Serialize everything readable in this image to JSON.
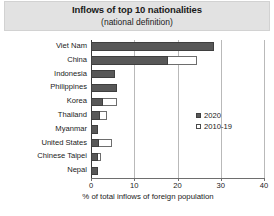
{
  "chart_data": {
    "type": "bar",
    "orientation": "horizontal",
    "title": "Inflows of top 10 nationalities",
    "subtitle": "(national definition)",
    "xlabel": "% of total inflows of foreign population",
    "ylabel": "",
    "xlim": [
      0,
      40
    ],
    "xticks": [
      0,
      10,
      20,
      30,
      40
    ],
    "xtick_labels": [
      "0",
      "10",
      "20",
      "30",
      "40"
    ],
    "grid": true,
    "grid_axis": "x",
    "legend_position": "center-right",
    "categories": [
      "Viet Nam",
      "China",
      "Indonesia",
      "Philippines",
      "Korea",
      "Thailand",
      "Myanmar",
      "United States",
      "Chinese Taipei",
      "Nepal"
    ],
    "series": [
      {
        "name": "2020",
        "color": "#585858",
        "style": "filled",
        "values": [
          28.5,
          17.8,
          5.6,
          6.0,
          2.8,
          2.1,
          1.7,
          1.9,
          1.6,
          1.6
        ]
      },
      {
        "name": "2010-19",
        "color": "#ffffff",
        "style": "hollow",
        "values": [
          13.6,
          24.4,
          4.6,
          2.3,
          6.0,
          3.7,
          1.4,
          4.8,
          2.3,
          1.0
        ]
      }
    ]
  },
  "legend": {
    "entries": [
      {
        "label": "2020",
        "swatch": "filled-square"
      },
      {
        "label": "2010-19",
        "swatch": "hollow-square"
      }
    ]
  },
  "colors": {
    "bar_2020": "#585858",
    "bar_2010_19": "#ffffff",
    "bar_outline": "#3f3f3f",
    "gridline": "#b9b9b9",
    "axis": "#6e6e6e",
    "title_band": "#e2e2e2",
    "text": "#1a1a1a",
    "background": "#ffffff"
  }
}
